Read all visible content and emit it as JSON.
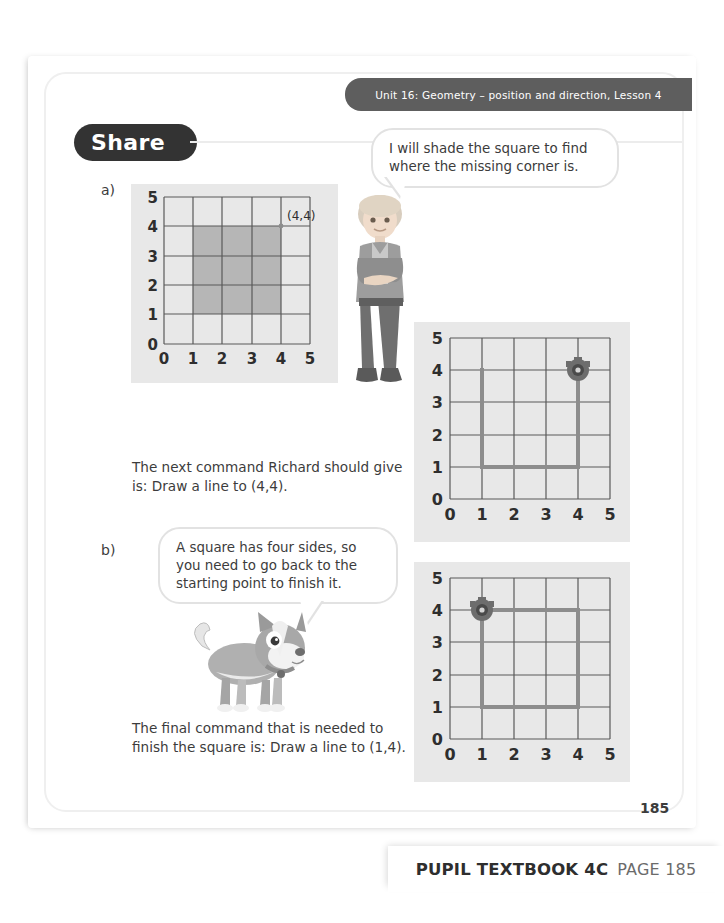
{
  "header": {
    "unit_label": "Unit 16: Geometry – position and direction, Lesson 4"
  },
  "section_tab": {
    "label": "Share"
  },
  "sections": [
    {
      "letter": "a)"
    },
    {
      "letter": "b)"
    }
  ],
  "speech_bubbles": [
    {
      "speaker": "boy",
      "text": "I will shade the square to find where the missing corner is."
    },
    {
      "speaker": "dog",
      "text": "A square has four sides, so you need to go back to the starting point to finish it."
    }
  ],
  "body_text": [
    {
      "id": "answer-a",
      "text": "The next command Richard should give is: Draw a line to (4,4)."
    },
    {
      "id": "answer-b",
      "text": "The final command that is needed to finish the square is: Draw a line to (1,4)."
    }
  ],
  "grids": [
    {
      "id": "grid-a",
      "axis_x_ticks": [
        "0",
        "1",
        "2",
        "3",
        "4",
        "5"
      ],
      "axis_y_ticks": [
        "0",
        "1",
        "2",
        "3",
        "4",
        "5"
      ],
      "point_label": "(4,4)",
      "shaded_region": {
        "x0": 1,
        "y0": 1,
        "x1": 4,
        "y1": 4
      },
      "shade_color": "#b6b6b6",
      "has_robot": false,
      "path": []
    },
    {
      "id": "grid-b",
      "axis_x_ticks": [
        "0",
        "1",
        "2",
        "3",
        "4",
        "5"
      ],
      "axis_y_ticks": [
        "0",
        "1",
        "2",
        "3",
        "4",
        "5"
      ],
      "point_label": "",
      "shaded_region": null,
      "shade_color": "#8d8d8d",
      "has_robot": true,
      "robot_at": {
        "x": 4,
        "y": 4
      },
      "path": [
        [
          1,
          4
        ],
        [
          1,
          1
        ],
        [
          4,
          1
        ],
        [
          4,
          4
        ]
      ]
    },
    {
      "id": "grid-c",
      "axis_x_ticks": [
        "0",
        "1",
        "2",
        "3",
        "4",
        "5"
      ],
      "axis_y_ticks": [
        "0",
        "1",
        "2",
        "3",
        "4",
        "5"
      ],
      "point_label": "",
      "shaded_region": null,
      "shade_color": "#8d8d8d",
      "has_robot": true,
      "robot_at": {
        "x": 1,
        "y": 4
      },
      "path": [
        [
          1,
          4
        ],
        [
          1,
          1
        ],
        [
          4,
          1
        ],
        [
          4,
          4
        ],
        [
          1,
          4
        ]
      ]
    }
  ],
  "page_number": "185",
  "footer": {
    "book_label": "PUPIL TEXTBOOK 4C",
    "page_label": "PAGE 185"
  },
  "colors": {
    "header_bar": "#5e5e5e",
    "tab": "#333333",
    "panel_bg": "#e8e8e8",
    "grid_line": "#595959",
    "path_line": "#8d8d8d",
    "shade": "#b6b6b6",
    "text": "#3c3c3c"
  }
}
